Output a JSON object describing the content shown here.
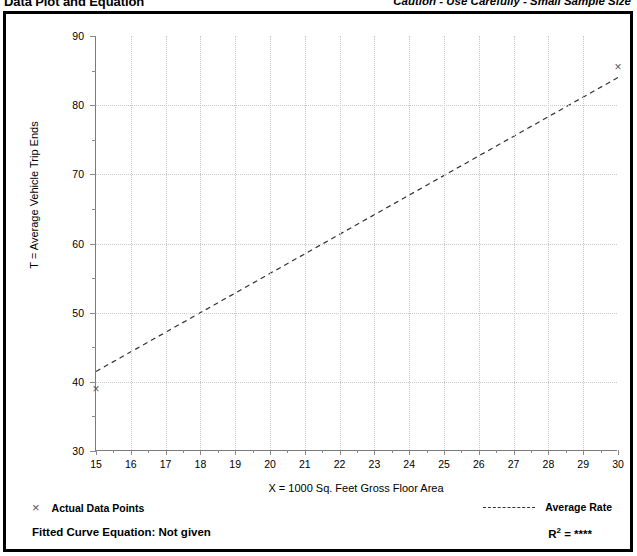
{
  "header": {
    "title": "Data Plot and Equation",
    "caution": "Caution - Use Carefully - Small Sample Size"
  },
  "legend": {
    "actual_marker": "×",
    "actual_label": "Actual Data Points",
    "average_label": "Average Rate"
  },
  "footer": {
    "fitted_label": "Fitted Curve Equation:",
    "fitted_value": "Not given",
    "fitted_full": "Fitted Curve Equation:  Not given",
    "r_label": "R",
    "r_exponent": "2",
    "r_value": "= ****",
    "r_full": "R2 = ****"
  },
  "chart_data": {
    "type": "scatter",
    "title": "Data Plot and Equation",
    "xlabel": "X = 1000 Sq. Feet Gross Floor Area",
    "ylabel": "T = Average Vehicle Trip Ends",
    "xlim": [
      15,
      30
    ],
    "ylim": [
      30,
      90
    ],
    "xticks": [
      15,
      16,
      17,
      18,
      19,
      20,
      21,
      22,
      23,
      24,
      25,
      26,
      27,
      28,
      29,
      30
    ],
    "yticks": [
      30,
      40,
      50,
      60,
      70,
      80,
      90
    ],
    "y_minor_step": 5,
    "grid": true,
    "legend_position": "below-plot",
    "series": [
      {
        "name": "Actual Data Points",
        "type": "scatter",
        "marker": "x",
        "color": "#555555",
        "points": [
          {
            "x": 15,
            "y": 39.0
          },
          {
            "x": 30,
            "y": 85.5
          }
        ]
      },
      {
        "name": "Average Rate",
        "type": "line",
        "style": "dashed",
        "color": "#333333",
        "points": [
          {
            "x": 15,
            "y": 41.5
          },
          {
            "x": 30,
            "y": 84.0
          }
        ]
      }
    ],
    "annotations": [
      "Caution - Use Carefully - Small Sample Size",
      "Fitted Curve Equation:  Not given",
      "R2 = ****"
    ]
  }
}
